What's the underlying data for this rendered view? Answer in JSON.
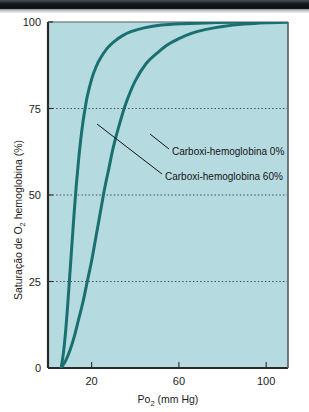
{
  "figure": {
    "background_color": "#ffffff",
    "plot_background_color": "#b5dbe0",
    "curve_color": "#1a7070",
    "axis_color": "#2a2a2a",
    "ghost_text": "MARCAS"
  },
  "chart_data": {
    "type": "line",
    "title": "",
    "xlabel": "Po2 (mm Hg)",
    "xlabel_main": "Po",
    "xlabel_sub": "2",
    "xlabel_units": " (mm Hg)",
    "ylabel": "Saturação de O2 hemoglobina (%)",
    "ylabel_part1": "Saturação de O",
    "ylabel_sub": "2",
    "ylabel_part2": " hemoglobina (%)",
    "xlim": [
      0,
      110
    ],
    "ylim": [
      0,
      100
    ],
    "xticks": [
      20,
      60,
      100
    ],
    "xtick_labels": [
      "20",
      "60",
      "100"
    ],
    "yticks": [
      0,
      25,
      50,
      75,
      100
    ],
    "ytick_labels": [
      "0",
      "25",
      "50",
      "75",
      "100"
    ],
    "grid": true,
    "gridlines_y": [
      25,
      50,
      75
    ],
    "grid_style": "dotted",
    "legend_position": "inline-annotation",
    "series": [
      {
        "name": "Carboxi-hemoglobina 0%",
        "color": "#1a7070",
        "x": [
          6,
          8,
          10,
          12,
          14,
          16,
          18,
          20,
          22,
          24,
          26,
          28,
          30,
          33,
          36,
          40,
          45,
          50,
          55,
          60,
          66,
          72,
          80,
          90,
          100,
          110
        ],
        "y": [
          0,
          2,
          5,
          9,
          14,
          19,
          25,
          31,
          38,
          45,
          52,
          58,
          64,
          71,
          77,
          83,
          88,
          91,
          93.5,
          95.2,
          96.8,
          97.8,
          98.7,
          99.4,
          99.8,
          100
        ]
      },
      {
        "name": "Carboxi-hemoglobina 60%",
        "color": "#1a7070",
        "x": [
          6,
          7,
          8,
          9,
          10,
          11,
          12,
          13,
          14,
          15,
          16,
          17,
          18,
          20,
          22,
          24,
          27,
          30,
          34,
          38,
          44,
          52,
          62,
          75,
          90,
          110
        ],
        "y": [
          0,
          4,
          10,
          18,
          27,
          36,
          45,
          53,
          60,
          66,
          71,
          75,
          78.5,
          83.5,
          87,
          89.5,
          92.3,
          94.2,
          96,
          97.2,
          98.3,
          99.1,
          99.5,
          99.8,
          99.95,
          100
        ]
      }
    ],
    "annotations": [
      {
        "text": "Carboxi-hemoglobina 0%",
        "points_to_series": "Carboxi-hemoglobina 0%",
        "label_x": 172,
        "label_y": 152
      },
      {
        "text": "Carboxi-hemoglobina 60%",
        "points_to_series": "Carboxi-hemoglobina 60%",
        "label_x": 165,
        "label_y": 177
      }
    ]
  }
}
